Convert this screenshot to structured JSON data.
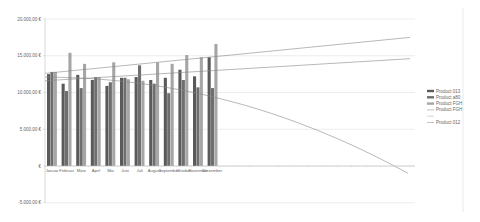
{
  "chart_data": {
    "type": "bar",
    "title": "",
    "xlabel": "",
    "ylabel": "",
    "ylim": [
      -5000,
      20000
    ],
    "yticks": [
      20000,
      15000,
      10000,
      5000,
      0,
      -5000
    ],
    "ytick_labels": [
      "20.000,00 €",
      "15.000,00 €",
      "10.000,00 €",
      "5.000,00 €",
      "€",
      "-5.000,00 €"
    ],
    "grid": true,
    "legend_position": "right",
    "categories": [
      "Januar",
      "Februar",
      "März",
      "April",
      "Mai",
      "Juni",
      "Juli",
      "August",
      "September",
      "Oktober",
      "November",
      "Dezember"
    ],
    "series": [
      {
        "name": "Product 013",
        "kind": "bar",
        "color": "#5a5a5a",
        "values": [
          12500,
          11200,
          12400,
          11700,
          10900,
          12000,
          12100,
          11700,
          12000,
          13100,
          12200,
          14800
        ]
      },
      {
        "name": "Product a80",
        "kind": "bar",
        "color": "#6e6e6e",
        "values": [
          12800,
          10200,
          10600,
          12100,
          11400,
          12000,
          13700,
          11200,
          9900,
          11700,
          10700,
          10600
        ]
      },
      {
        "name": "Product FGH",
        "kind": "bar",
        "color": "#a6a6a6",
        "values": [
          12800,
          15400,
          13900,
          12100,
          14100,
          11800,
          11600,
          14100,
          13900,
          15100,
          14800,
          16600
        ]
      }
    ],
    "trendlines": [
      {
        "name": "Product FGH",
        "kind": "linear",
        "color": "#888888",
        "start": 12600,
        "end": 17500
      },
      {
        "name": "",
        "kind": "linear",
        "color": "#888888",
        "start": 11600,
        "end": 14600
      },
      {
        "name": "Product 012",
        "kind": "polynomial",
        "color": "#888888",
        "start": 12100,
        "end": -1000
      }
    ],
    "legend": [
      {
        "label": "Product 013",
        "swatch": "bar",
        "color": "#5a5a5a"
      },
      {
        "label": "Product a80",
        "swatch": "bar",
        "color": "#6e6e6e"
      },
      {
        "label": "Product FGH",
        "swatch": "bar",
        "color": "#a6a6a6"
      },
      {
        "label": "Product FGH",
        "swatch": "line",
        "color": "#999999"
      },
      {
        "label": "",
        "swatch": "line",
        "color": "#bbbbbb"
      },
      {
        "label": "Product 012",
        "swatch": "line",
        "color": "#999999"
      }
    ]
  }
}
